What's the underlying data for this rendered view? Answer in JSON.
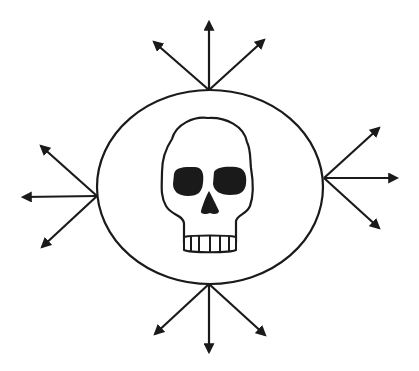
{
  "diagram": {
    "colors": {
      "stroke": "#1a1a1a",
      "background": "#ffffff"
    },
    "center_icon": "skull-icon",
    "ellipse": {
      "cx": 210,
      "cy": 187,
      "rx": 113,
      "ry": 97
    },
    "arrow_groups": [
      {
        "name": "top",
        "origin": [
          209,
          90
        ],
        "targets": [
          [
            209,
            22
          ],
          [
            154,
            42
          ],
          [
            264,
            40
          ]
        ]
      },
      {
        "name": "left",
        "origin": [
          97,
          196
        ],
        "targets": [
          [
            23,
            197
          ],
          [
            41,
            146
          ],
          [
            42,
            247
          ]
        ]
      },
      {
        "name": "right",
        "origin": [
          324,
          178
        ],
        "targets": [
          [
            397,
            178
          ],
          [
            379,
            128
          ],
          [
            379,
            228
          ]
        ]
      },
      {
        "name": "bottom",
        "origin": [
          209,
          284
        ],
        "targets": [
          [
            209,
            352
          ],
          [
            155,
            334
          ],
          [
            265,
            335
          ]
        ]
      }
    ]
  }
}
